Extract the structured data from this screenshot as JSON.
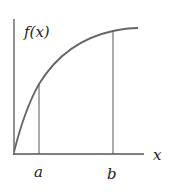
{
  "diagram": {
    "y_label": "f(x)",
    "x_label": "x",
    "markers": [
      {
        "label": "a"
      },
      {
        "label": "b"
      }
    ],
    "colors": {
      "axis": "#555555",
      "curve": "#666666",
      "text": "#222222"
    }
  }
}
